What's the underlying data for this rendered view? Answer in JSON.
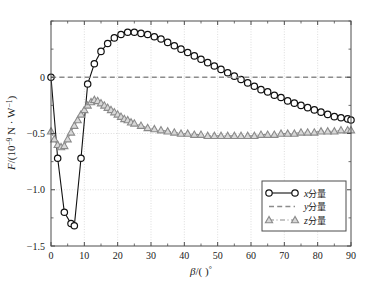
{
  "chart_data": {
    "type": "line",
    "title": "",
    "xlabel": "β/( )°",
    "ylabel": "F/(10⁻⁹ N · W⁻¹)",
    "xlim": [
      0,
      90
    ],
    "ylim": [
      -1.5,
      0.5
    ],
    "xticks": [
      0,
      10,
      20,
      30,
      40,
      50,
      60,
      70,
      80,
      90
    ],
    "xticklabels": [
      "0",
      "10",
      "20",
      "30",
      "40",
      "50",
      "60",
      "70",
      "80",
      "90"
    ],
    "yticks": [
      -1.5,
      -1.0,
      -0.5,
      0.0
    ],
    "yticklabels": [
      "−1.5",
      "−1.0",
      "−0.5",
      "0"
    ],
    "minor_xtick_step": 5,
    "minor_ytick_step": 0.25,
    "grid": true,
    "grid_color": "#cfcfcf",
    "frame_color": "#4d4d4d",
    "legend_position": "lower right",
    "series": [
      {
        "name": "x分量",
        "name_italic_prefix": "x",
        "name_rest": "分量",
        "marker": "circle-open",
        "color": "#111111",
        "linestyle": "solid",
        "x": [
          0,
          2,
          4,
          6,
          7,
          9,
          11,
          13,
          15,
          17,
          19,
          21,
          23,
          25,
          27,
          29,
          31,
          33,
          35,
          37,
          39,
          41,
          43,
          45,
          47,
          49,
          51,
          53,
          55,
          57,
          59,
          61,
          63,
          65,
          67,
          69,
          71,
          73,
          75,
          77,
          79,
          81,
          83,
          85,
          87,
          89,
          90
        ],
        "y": [
          0.0,
          -0.72,
          -1.2,
          -1.3,
          -1.32,
          -0.72,
          -0.06,
          0.12,
          0.23,
          0.3,
          0.35,
          0.38,
          0.4,
          0.4,
          0.39,
          0.38,
          0.36,
          0.34,
          0.31,
          0.28,
          0.25,
          0.22,
          0.19,
          0.16,
          0.13,
          0.1,
          0.07,
          0.04,
          0.01,
          -0.02,
          -0.05,
          -0.08,
          -0.11,
          -0.13,
          -0.16,
          -0.18,
          -0.21,
          -0.23,
          -0.25,
          -0.27,
          -0.29,
          -0.31,
          -0.33,
          -0.35,
          -0.36,
          -0.37,
          -0.38
        ]
      },
      {
        "name": "y分量",
        "name_italic_prefix": "y",
        "name_rest": "分量",
        "marker": "none",
        "color": "#8c8c8c",
        "linestyle": "dashed",
        "x": [
          0,
          90
        ],
        "y": [
          0.0,
          0.0
        ]
      },
      {
        "name": "z分量",
        "name_italic_prefix": "z",
        "name_rest": "分量",
        "marker": "triangle-open",
        "color": "#8a8a8a",
        "linestyle": "dashdot",
        "x": [
          0,
          1,
          2,
          3,
          4,
          5,
          6,
          7,
          8,
          9,
          10,
          11,
          12,
          13,
          14,
          15,
          16,
          17,
          18,
          19,
          20,
          21,
          22,
          23,
          24,
          25,
          27,
          29,
          31,
          33,
          35,
          37,
          39,
          41,
          43,
          45,
          47,
          49,
          51,
          53,
          55,
          57,
          59,
          61,
          63,
          65,
          67,
          69,
          71,
          73,
          75,
          77,
          79,
          81,
          83,
          85,
          87,
          89,
          90
        ],
        "y": [
          -0.48,
          -0.55,
          -0.6,
          -0.62,
          -0.61,
          -0.55,
          -0.49,
          -0.43,
          -0.38,
          -0.33,
          -0.29,
          -0.25,
          -0.22,
          -0.2,
          -0.21,
          -0.23,
          -0.25,
          -0.27,
          -0.29,
          -0.31,
          -0.33,
          -0.35,
          -0.37,
          -0.38,
          -0.4,
          -0.41,
          -0.43,
          -0.45,
          -0.46,
          -0.47,
          -0.48,
          -0.49,
          -0.5,
          -0.5,
          -0.51,
          -0.51,
          -0.52,
          -0.52,
          -0.52,
          -0.52,
          -0.52,
          -0.52,
          -0.52,
          -0.52,
          -0.51,
          -0.51,
          -0.51,
          -0.5,
          -0.5,
          -0.5,
          -0.49,
          -0.49,
          -0.49,
          -0.48,
          -0.48,
          -0.48,
          -0.47,
          -0.47,
          -0.47
        ]
      }
    ]
  },
  "legend": {
    "items": [
      {
        "label": "x分量",
        "italic": "x",
        "rest": "分量"
      },
      {
        "label": "y分量",
        "italic": "y",
        "rest": "分量"
      },
      {
        "label": "z分量",
        "italic": "z",
        "rest": "分量"
      }
    ]
  },
  "axes": {
    "ylabel_parts": {
      "f": "F",
      "slash": "/(10",
      "exp": "−9",
      "unit": " N · W",
      "exp2": "−1",
      "close": ")"
    },
    "xlabel_parts": {
      "beta": "β",
      "mid": "/(  )",
      "deg": "°"
    }
  }
}
